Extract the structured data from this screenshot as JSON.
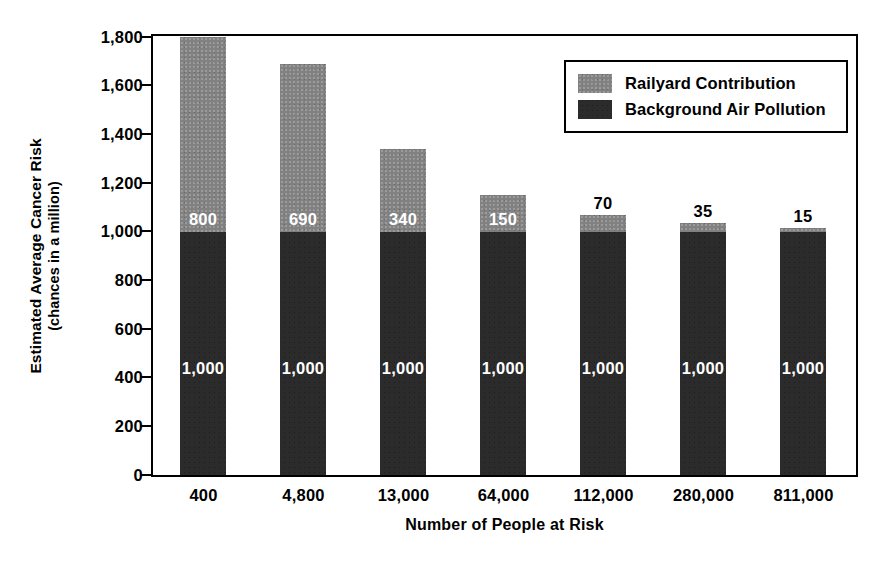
{
  "chart_data": {
    "type": "bar",
    "stacked": true,
    "title": "",
    "xlabel": "Number of People at Risk",
    "ylabel": "Estimated Average Cancer Risk",
    "ylabel_line2": "(chances in a million)",
    "ylim": [
      0,
      1800
    ],
    "yticks": [
      0,
      200,
      400,
      600,
      800,
      1000,
      1200,
      1400,
      1600,
      1800
    ],
    "ytick_labels": [
      "0",
      "200",
      "400",
      "600",
      "800",
      "1,000",
      "1,200",
      "1,400",
      "1,600",
      "1,800"
    ],
    "grid": false,
    "legend_position": "inside-top-right",
    "categories": [
      "400",
      "4,800",
      "13,000",
      "64,000",
      "112,000",
      "280,000",
      "811,000"
    ],
    "series": [
      {
        "name": "Background Air Pollution",
        "color": "#2b2b2b",
        "values": [
          1000,
          1000,
          1000,
          1000,
          1000,
          1000,
          1000
        ],
        "labels": [
          "1,000",
          "1,000",
          "1,000",
          "1,000",
          "1,000",
          "1,000",
          "1,000"
        ],
        "label_color": "#ffffff",
        "label_placement": [
          "inside",
          "inside",
          "inside",
          "inside",
          "inside",
          "inside",
          "inside"
        ]
      },
      {
        "name": "Railyard Contribution",
        "color": "#818181",
        "values": [
          800,
          690,
          340,
          150,
          70,
          35,
          15
        ],
        "labels": [
          "800",
          "690",
          "340",
          "150",
          "70",
          "35",
          "15"
        ],
        "label_color_inside": "#ffffff",
        "label_color_above": "#000000",
        "label_placement": [
          "inside",
          "inside",
          "inside",
          "inside",
          "above",
          "above",
          "above"
        ]
      }
    ],
    "totals": [
      1800,
      1690,
      1340,
      1150,
      1070,
      1035,
      1015
    ]
  },
  "legend": {
    "items": [
      {
        "label": "Railyard Contribution",
        "swatch": "light"
      },
      {
        "label": "Background Air Pollution",
        "swatch": "dark"
      }
    ]
  },
  "colors": {
    "railyard": "#818181",
    "background_air": "#2b2b2b",
    "axis": "#000000",
    "canvas": "#ffffff"
  }
}
